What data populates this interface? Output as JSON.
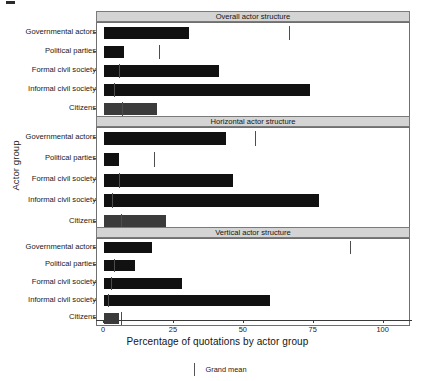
{
  "chart_data": {
    "type": "bar",
    "orientation": "horizontal",
    "title": "",
    "xlabel": "Percentage of quotations by actor group",
    "ylabel": "Actor group",
    "xlim": [
      0,
      108
    ],
    "xticks": [
      0,
      25,
      50,
      75,
      100
    ],
    "xticklabels": [
      "0",
      "25",
      "50",
      "75",
      "100"
    ],
    "grid": false,
    "categories": [
      "Governmental actors",
      "Political parties",
      "Formal civil society",
      "Informal civil society",
      "Citizens"
    ],
    "facets": [
      {
        "label": "Overall actor structure",
        "values": [
          30.5,
          7.0,
          41.0,
          73.5,
          19.0
        ],
        "grand_mean": 66.0,
        "grand_mean_marks": [
          66.0,
          19.5,
          5.5,
          3.5,
          6.5
        ]
      },
      {
        "label": "Horizontal actor structure",
        "values": [
          43.5,
          5.5,
          46.0,
          77.0,
          22.0
        ],
        "grand_mean": 54.0,
        "grand_mean_marks": [
          54.0,
          18.0,
          5.5,
          3.0,
          6.0
        ]
      },
      {
        "label": "Vertical actor structure",
        "values": [
          17.0,
          11.0,
          28.0,
          59.5,
          5.5
        ],
        "grand_mean": 88.0,
        "grand_mean_marks": [
          88.0,
          3.5,
          2.5,
          1.5,
          6.0
        ]
      }
    ],
    "legend": {
      "position": "bottom",
      "entries": [
        {
          "label": "Grand mean",
          "marker": "vline",
          "color": "#555555"
        }
      ]
    },
    "colors": {
      "bar": "#111111",
      "bar_light": "#3b3b3b",
      "strip_background": "#d4d4d4",
      "panel_border": "#6f6f6f",
      "grand_mean": "#4d4d4d"
    }
  }
}
